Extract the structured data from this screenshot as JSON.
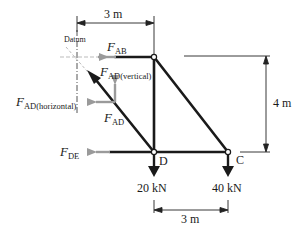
{
  "diagram": {
    "type": "truss-free-body-diagram",
    "labels": {
      "datum": "Datum",
      "f_ab_main": "F",
      "f_ab_sub": "AB",
      "f_ad_vertical_main": "F",
      "f_ad_vertical_sub": "AD(vertical)",
      "f_ad_horizontal_main": "F",
      "f_ad_horizontal_sub": "AD(horizontal)",
      "f_ad_main": "F",
      "f_ad_sub": "AD",
      "f_de_main": "F",
      "f_de_sub": "DE",
      "node_d": "D",
      "node_c": "C",
      "load_d": "20 kN",
      "load_c": "40 kN",
      "dim_top": "3 m",
      "dim_right": "4 m",
      "dim_bottom": "3 m"
    },
    "colors": {
      "member": "#1a1a1a",
      "force_arrow": "#9a9a9a",
      "dimension": "#333333",
      "datum_line": "#888888"
    }
  }
}
